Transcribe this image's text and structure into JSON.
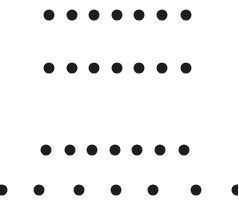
{
  "diagram": {
    "type": "dot-rows",
    "dot_color": "#1e1e1e",
    "background": "#ffffff",
    "rows": [
      {
        "name": "row-1",
        "y": 15,
        "count": 7,
        "x": [
          49,
          72,
          94,
          117,
          139,
          162,
          186
        ]
      },
      {
        "name": "row-2",
        "y": 68,
        "count": 7,
        "x": [
          49,
          72,
          94,
          117,
          139,
          162,
          186
        ]
      },
      {
        "name": "row-3",
        "y": 150,
        "count": 7,
        "x": [
          46,
          70,
          92,
          115,
          137,
          160,
          184
        ]
      },
      {
        "name": "row-4",
        "y": 190,
        "count": 7,
        "x": [
          2,
          39,
          79,
          116,
          153,
          196,
          237
        ]
      }
    ]
  }
}
